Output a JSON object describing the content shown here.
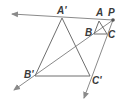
{
  "diagram": {
    "type": "dilation",
    "center": {
      "label": "P",
      "x": 113,
      "y": 20
    },
    "original_triangle": {
      "vertices": [
        {
          "label": "A",
          "x": 99,
          "y": 21
        },
        {
          "label": "B",
          "x": 94,
          "y": 34
        },
        {
          "label": "C",
          "x": 107,
          "y": 34
        }
      ]
    },
    "image_triangle": {
      "vertices": [
        {
          "label": "A'",
          "x": 62,
          "y": 18
        },
        {
          "label": "B'",
          "x": 35,
          "y": 76
        },
        {
          "label": "C'",
          "x": 90,
          "y": 76
        }
      ]
    },
    "rays": [
      {
        "from": "P",
        "through": "A'",
        "end": [
          12,
          14
        ]
      },
      {
        "from": "P",
        "through": "B'",
        "end": [
          14,
          90
        ]
      },
      {
        "from": "P",
        "through": "C'",
        "end": [
          84,
          98
        ]
      }
    ],
    "colors": {
      "line": "#8a8a8a",
      "triangle": "#6e6e6e",
      "label": "#3a3a3a",
      "point": "#555555"
    }
  }
}
